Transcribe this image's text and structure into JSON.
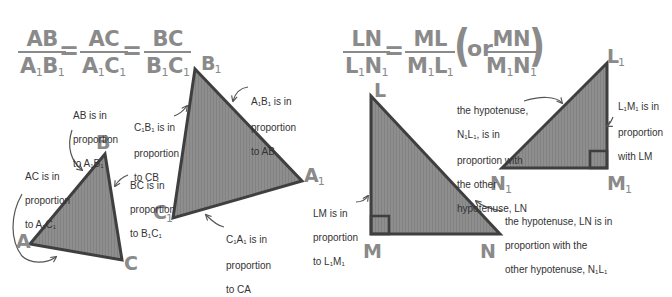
{
  "colors": {
    "triangle_fill": "#8c8c8c",
    "triangle_stroke": "#3f3f3f",
    "label_gray": "#8a8a8a",
    "annotation_text": "#333333",
    "arrow": "#555555"
  },
  "left_equation": {
    "fractions": [
      {
        "num": "AB",
        "den_parts": [
          "A",
          "1",
          "B",
          "1"
        ]
      },
      {
        "num": "AC",
        "den_parts": [
          "A",
          "1",
          "C",
          "1"
        ]
      },
      {
        "num": "BC",
        "den_parts": [
          "B",
          "1",
          "C",
          "1"
        ]
      }
    ],
    "equals": "="
  },
  "right_equation": {
    "fractions": [
      {
        "num": "LN",
        "den_parts": [
          "L",
          "1",
          "N",
          "1"
        ]
      },
      {
        "num": "ML",
        "den_parts": [
          "M",
          "1",
          "L",
          "1"
        ]
      },
      {
        "num": "MN",
        "den_parts": [
          "M",
          "1",
          "N",
          "1"
        ]
      }
    ],
    "equals": "=",
    "or_text": "or",
    "open_paren": "(",
    "close_paren": ")"
  },
  "triangles": {
    "abc": {
      "vertices": {
        "A": "A",
        "B": "B",
        "C": "C"
      },
      "notes": {
        "ab": {
          "line1": "AB is in",
          "line2": "proportion",
          "line3_prefix": "to A",
          "line3_mid": "B",
          "sub": "1"
        },
        "ac": {
          "line1": "AC is in",
          "line2": "proportion",
          "line3_prefix": "to A",
          "line3_mid": "C",
          "sub": "1"
        },
        "bc": {
          "line1": "BC is in",
          "line2": "proportion",
          "line3_prefix": "to B",
          "line3_mid": "C",
          "sub": "1"
        }
      }
    },
    "a1b1c1": {
      "vertices": {
        "A1": "A",
        "B1": "B",
        "C1": "C",
        "sub": "1"
      },
      "notes": {
        "c1b1": {
          "line1_a": "C",
          "line1_b": "B",
          "line1_c": " is in",
          "line2": "proportion",
          "line3": "to CB",
          "sub": "1"
        },
        "a1b1": {
          "line1_a": "A",
          "line1_b": "B",
          "line1_c": " is in",
          "line2": "proportion",
          "line3": "to AB",
          "sub": "1"
        },
        "c1a1": {
          "line1_a": "C",
          "line1_b": "A",
          "line1_c": " is in",
          "line2": "proportion",
          "line3": "to CA",
          "sub": "1"
        }
      }
    },
    "lmn": {
      "vertices": {
        "L": "L",
        "M": "M",
        "N": "N"
      },
      "notes": {
        "lm": {
          "line1": "LM is in",
          "line2": "proportion",
          "line3_prefix": "to L",
          "line3_mid": "M",
          "sub": "1"
        },
        "ln": {
          "line1": "the hypotenuse, LN is in",
          "line2": "proportion with the",
          "line3_prefix": "other hypotenuse, N",
          "line3_mid": "L",
          "sub": "1"
        }
      }
    },
    "l1m1n1": {
      "vertices": {
        "L1": "L",
        "M1": "M",
        "N1": "N",
        "sub": "1"
      },
      "notes": {
        "n1l1": {
          "line1": "the hypotenuse,",
          "line2_a": "N",
          "line2_b": "L",
          "line2_c": ", is in",
          "line3": "proportion with",
          "line4": "the other",
          "line5": "hypotenuse, LN",
          "sub": "1"
        },
        "l1m1": {
          "line1_a": "L",
          "line1_b": "M",
          "line1_c": " is in",
          "line2": "proportion",
          "line3": "with LM",
          "sub": "1"
        }
      }
    }
  }
}
